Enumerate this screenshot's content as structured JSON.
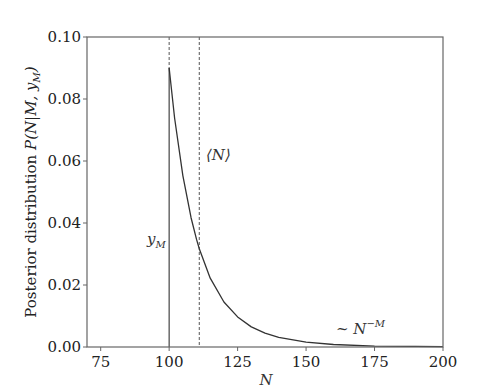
{
  "chart_data": {
    "type": "line",
    "title": "",
    "xlabel": "N",
    "ylabel": "Posterior distribution P(N|M, y_M)",
    "xlim": [
      70,
      200
    ],
    "ylim": [
      0.0,
      0.1
    ],
    "x_ticks": [
      75,
      100,
      125,
      150,
      175,
      200
    ],
    "x_tick_labels": [
      "75",
      "100",
      "125",
      "150",
      "175",
      "200"
    ],
    "y_ticks": [
      0.0,
      0.02,
      0.04,
      0.06,
      0.08,
      0.1
    ],
    "y_tick_labels": [
      "0.00",
      "0.02",
      "0.04",
      "0.06",
      "0.08",
      "0.10"
    ],
    "grid": false,
    "legend": null,
    "series": [
      {
        "name": "posterior",
        "style": "solid",
        "x": [
          100,
          102,
          105,
          108,
          110,
          111,
          115,
          120,
          125,
          130,
          135,
          140,
          150,
          160,
          175,
          190,
          200
        ],
        "y": [
          0.09,
          0.0738,
          0.0553,
          0.0417,
          0.0347,
          0.0317,
          0.0222,
          0.0145,
          0.0097,
          0.0065,
          0.0045,
          0.0031,
          0.0016,
          0.0008,
          0.0003,
          0.0002,
          0.0001
        ]
      }
    ],
    "vlines": [
      {
        "x": 100,
        "style": "dashed-top-solid-bottom",
        "label": "y_M"
      },
      {
        "x": 111,
        "style": "dashed",
        "label": "⟨N⟩"
      }
    ],
    "annotations": [
      {
        "text": "y_M",
        "x": 92,
        "y": 0.045
      },
      {
        "text": "⟨N⟩",
        "x": 113,
        "y": 0.062
      },
      {
        "text": "~ N^-M",
        "x": 160,
        "y": 0.002
      }
    ]
  },
  "labels": {
    "xlabel": "N",
    "ylabel_text": "Posterior distribution ",
    "ylabel_math": "P(N|M, y",
    "ylabel_sub": "M",
    "ylabel_close": ")",
    "ym_main": "y",
    "ym_sub": "M",
    "mean_label": "⟨N⟩",
    "tail_main": "~ N",
    "tail_sup": "−M"
  }
}
